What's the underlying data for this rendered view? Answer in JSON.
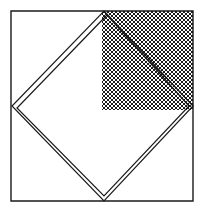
{
  "canvas": {
    "width": 211,
    "height": 214,
    "background_color": "#ffffff",
    "title": "Square with inscribed diamond and cross-hatched upper-right quadrant"
  },
  "style": {
    "stroke_color": "#1a1a1a",
    "hatch_color": "#1a1a1a",
    "outer_square_stroke_width": 1.4,
    "diamond_stroke_width": 1.2,
    "hatch_stroke_width": 1.0,
    "hatch_spacing_px": 4
  },
  "chart_data": {
    "type": "diagram",
    "xlabel": "",
    "ylabel": "",
    "xlim": [
      0,
      211
    ],
    "ylim": [
      0,
      214
    ],
    "grid": false,
    "legend": "none",
    "shapes": [
      {
        "name": "outer-square",
        "type": "polygon",
        "closed": true,
        "fill": "none",
        "stroke": "#1a1a1a",
        "stroke_width": 1.4,
        "points": [
          [
            11,
            11
          ],
          [
            193,
            11
          ],
          [
            193,
            201
          ],
          [
            11,
            201
          ]
        ]
      },
      {
        "name": "hatched-quadrant",
        "type": "rect",
        "fill": "cross-hatch",
        "stroke": "none",
        "x": 102,
        "y": 11,
        "width": 91,
        "height": 99
      },
      {
        "name": "diamond-outer",
        "type": "polygon",
        "closed": true,
        "fill": "none",
        "stroke": "#1a1a1a",
        "stroke_width": 1.2,
        "points": [
          [
            104,
            11
          ],
          [
            193,
            106
          ],
          [
            104,
            201
          ],
          [
            12,
            106
          ]
        ]
      },
      {
        "name": "diamond-inner",
        "type": "polygon",
        "closed": true,
        "fill": "none",
        "stroke": "#1a1a1a",
        "stroke_width": 1.2,
        "points": [
          [
            107,
            15
          ],
          [
            189,
            106
          ],
          [
            104,
            196
          ],
          [
            17,
            108
          ]
        ]
      }
    ],
    "annotations": []
  }
}
